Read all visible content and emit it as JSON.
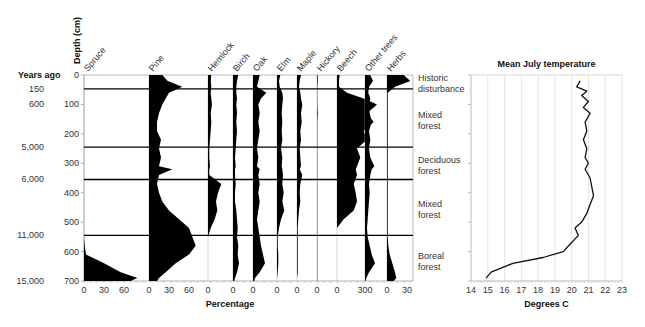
{
  "chart_data": [
    {
      "type": "area",
      "title": "Pollen diagram",
      "ylabel": "Depth (cm)",
      "xlabel": "Percentage",
      "years_label": "Years ago",
      "ylim": [
        0,
        700
      ],
      "yticks": [
        0,
        100,
        200,
        300,
        400,
        500,
        600,
        700
      ],
      "years_ago": [
        {
          "label": "150",
          "depth": 47
        },
        {
          "label": "600",
          "depth": 100
        },
        {
          "label": "5,000",
          "depth": 245
        },
        {
          "label": "6,000",
          "depth": 355
        },
        {
          "label": "11,000",
          "depth": 545
        },
        {
          "label": "15,000",
          "depth": 700
        }
      ],
      "zone_boundaries": [
        47,
        245,
        355,
        545
      ],
      "zones": [
        {
          "label_lines": [
            "Historic",
            "disturbance"
          ],
          "depth": 20
        },
        {
          "label_lines": [
            "Mixed",
            "forest"
          ],
          "depth": 145
        },
        {
          "label_lines": [
            "Deciduous",
            "forest"
          ],
          "depth": 300
        },
        {
          "label_lines": [
            "Mixed",
            "forest"
          ],
          "depth": 450
        },
        {
          "label_lines": [
            "Boreal",
            "forest"
          ],
          "depth": 625
        }
      ],
      "depths": [
        0,
        20,
        40,
        60,
        80,
        100,
        130,
        160,
        190,
        220,
        250,
        280,
        310,
        320,
        340,
        370,
        400,
        430,
        460,
        490,
        520,
        550,
        580,
        610,
        640,
        670,
        690,
        700
      ],
      "series": [
        {
          "name": "Spruce",
          "tick_labels": [
            "0",
            "30",
            "60"
          ],
          "values": [
            0,
            0,
            0,
            0,
            0,
            0,
            0,
            0,
            0,
            0,
            0,
            0,
            0,
            0,
            0,
            0,
            0,
            0,
            0,
            0,
            0,
            0,
            1,
            3,
            30,
            55,
            80,
            70
          ]
        },
        {
          "name": "Pine",
          "tick_labels": [
            "0",
            "30",
            "60"
          ],
          "values": [
            20,
            28,
            50,
            30,
            25,
            20,
            15,
            12,
            12,
            18,
            15,
            18,
            15,
            35,
            15,
            12,
            15,
            20,
            30,
            45,
            60,
            65,
            70,
            60,
            40,
            25,
            15,
            12
          ]
        },
        {
          "name": "Hemlock",
          "tick_labels": [
            "0"
          ],
          "values": [
            5,
            4,
            5,
            4,
            5,
            6,
            4,
            5,
            4,
            3,
            2,
            2,
            3,
            2,
            2,
            20,
            15,
            12,
            14,
            10,
            4,
            0,
            0,
            0,
            0,
            0,
            0,
            0
          ]
        },
        {
          "name": "Birch",
          "tick_labels": [
            "0"
          ],
          "values": [
            8,
            6,
            5,
            5,
            6,
            5,
            6,
            5,
            6,
            5,
            4,
            3,
            4,
            3,
            3,
            4,
            3,
            3,
            5,
            6,
            7,
            6,
            8,
            7,
            9,
            6,
            3,
            2
          ]
        },
        {
          "name": "Oak",
          "tick_labels": [
            "0"
          ],
          "values": [
            10,
            8,
            6,
            20,
            12,
            8,
            10,
            8,
            10,
            8,
            6,
            8,
            6,
            10,
            8,
            10,
            8,
            10,
            8,
            6,
            8,
            10,
            12,
            15,
            18,
            10,
            3,
            2
          ]
        },
        {
          "name": "Elm",
          "tick_labels": [
            "0"
          ],
          "values": [
            5,
            3,
            4,
            8,
            9,
            8,
            7,
            8,
            7,
            8,
            6,
            8,
            7,
            8,
            9,
            8,
            10,
            8,
            11,
            6,
            3,
            1,
            1,
            2,
            2,
            1,
            0,
            0
          ]
        },
        {
          "name": "Maple",
          "tick_labels": [
            "0"
          ],
          "values": [
            6,
            4,
            3,
            5,
            6,
            8,
            6,
            7,
            5,
            6,
            4,
            5,
            6,
            4,
            8,
            5,
            4,
            5,
            3,
            2,
            1,
            1,
            1,
            1,
            1,
            1,
            0,
            0
          ]
        },
        {
          "name": "Hickory",
          "tick_labels": [
            "0"
          ],
          "values": [
            1,
            1,
            0.5,
            0.5,
            0.5,
            0.5,
            1,
            0.5,
            0.5,
            0.5,
            0.5,
            0.5,
            0.5,
            0.5,
            0.5,
            0.5,
            0.5,
            0.5,
            0.5,
            0.5,
            0.5,
            0.5,
            0.5,
            0.5,
            0.5,
            0.5,
            0.5,
            0.5
          ]
        },
        {
          "name": "Beech",
          "tick_labels": [
            "0"
          ],
          "values": [
            4,
            3,
            3,
            15,
            40,
            60,
            45,
            55,
            40,
            45,
            30,
            35,
            30,
            28,
            30,
            25,
            28,
            30,
            25,
            10,
            0,
            0,
            0,
            0,
            0,
            0,
            0,
            0
          ]
        },
        {
          "name": "Other trees",
          "tick_labels": [
            "300"
          ],
          "values": [
            8,
            12,
            6,
            5,
            8,
            6,
            7,
            10,
            6,
            8,
            6,
            8,
            14,
            10,
            8,
            6,
            7,
            6,
            5,
            4,
            3,
            4,
            7,
            10,
            15,
            6,
            2,
            1
          ]
        },
        {
          "name": "Herbs",
          "tick_labels": [
            "0",
            "30"
          ],
          "values": [
            25,
            35,
            12,
            1,
            1,
            1,
            1,
            1,
            1,
            1,
            1,
            1,
            1,
            1,
            1,
            1,
            1,
            1,
            1,
            1,
            1,
            1,
            2,
            4,
            8,
            12,
            14,
            10
          ]
        }
      ]
    },
    {
      "type": "line",
      "title": "Mean July temperature",
      "xlabel": "Degrees C",
      "xlim": [
        14,
        23
      ],
      "xticks": [
        "14",
        "15",
        "16",
        "17",
        "18",
        "19",
        "20",
        "21",
        "22",
        "23"
      ],
      "ylim": [
        0,
        700
      ],
      "grid": true,
      "x": [
        20.5,
        20.3,
        20.9,
        20.6,
        21.0,
        20.7,
        21.1,
        20.8,
        20.9,
        20.7,
        20.9,
        20.8,
        21.0,
        20.8,
        21.1,
        21.2,
        21.3,
        21.1,
        20.9,
        20.6,
        20.2,
        20.4,
        19.9,
        19.5,
        18.3,
        16.5,
        15.2,
        14.9
      ],
      "depths": [
        20,
        40,
        55,
        70,
        90,
        110,
        130,
        160,
        190,
        220,
        250,
        280,
        300,
        320,
        350,
        380,
        410,
        440,
        470,
        500,
        520,
        545,
        575,
        600,
        620,
        640,
        670,
        690
      ]
    }
  ]
}
